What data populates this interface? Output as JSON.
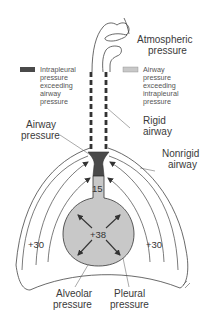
{
  "labels": {
    "atmospheric": [
      "Atmospheric",
      "pressure"
    ],
    "airway_pressure": [
      "Airway",
      "pressure"
    ],
    "rigid_airway": [
      "Rigid",
      "airway"
    ],
    "nonrigid_airway": [
      "Nonrigid",
      "airway"
    ],
    "alveolar_pressure": [
      "Alveolar",
      "pressure"
    ],
    "pleural_pressure": [
      "Pleural",
      "pressure"
    ]
  },
  "legend": [
    {
      "swatch_color": "#4a4a4a",
      "lines": [
        "Intrapleural",
        "pressure",
        "exceeding",
        "airway",
        "pressure"
      ]
    },
    {
      "swatch_color": "#c8c8c8",
      "lines": [
        "Airway",
        "pressure",
        "exceeding",
        "intrapleural",
        "pressure"
      ]
    }
  ],
  "values": {
    "airway": "15",
    "alveolar": "+38",
    "pleural_left": "+30",
    "pleural_right": "+30"
  },
  "colors": {
    "dark": "#4a4a4a",
    "light": "#c8c8c8",
    "line": "#444444"
  }
}
